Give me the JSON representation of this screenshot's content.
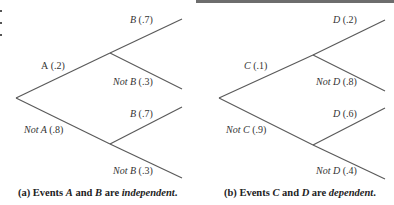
{
  "diagrams": [
    {
      "id": "a",
      "caption": {
        "prefix": "(a)  Events ",
        "var1": "A",
        "mid": " and ",
        "var2": "B",
        "are": " are ",
        "relation": "independent",
        "end": "."
      },
      "nodes": {
        "first_yes": {
          "event": "A",
          "prob": "(.2)"
        },
        "first_no": {
          "event": "Not A",
          "prob": "(.8)"
        },
        "upper_yes": {
          "event": "B",
          "prob": "(.7)"
        },
        "upper_no": {
          "event": "Not B",
          "prob": "(.3)"
        },
        "lower_yes": {
          "event": "B",
          "prob": "(.7)"
        },
        "lower_no": {
          "event": "Not B",
          "prob": "(.3)"
        }
      }
    },
    {
      "id": "b",
      "caption": {
        "prefix": "(b)  Events ",
        "var1": "C",
        "mid": " and ",
        "var2": "D",
        "are": " are ",
        "relation": "dependent",
        "end": "."
      },
      "nodes": {
        "first_yes": {
          "event": "C",
          "prob": "(.1)"
        },
        "first_no": {
          "event": "Not C",
          "prob": "(.9)"
        },
        "upper_yes": {
          "event": "D",
          "prob": "(.2)"
        },
        "upper_no": {
          "event": "Not D",
          "prob": "(.8)"
        },
        "lower_yes": {
          "event": "D",
          "prob": "(.6)"
        },
        "lower_no": {
          "event": "Not D",
          "prob": "(.4)"
        }
      }
    }
  ],
  "colors": {
    "line": "#5a5a5a",
    "text": "#2a2a2a",
    "topbar": "#6d6d6d"
  }
}
